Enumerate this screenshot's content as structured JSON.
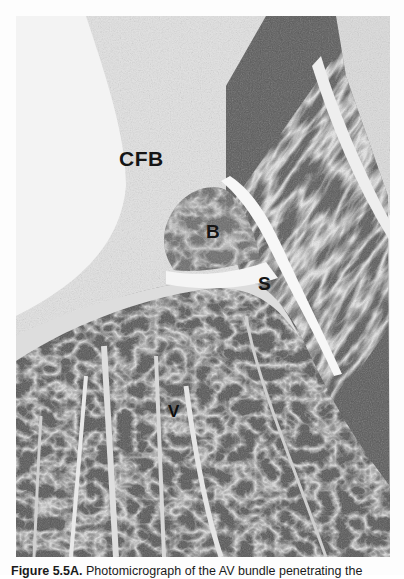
{
  "figure": {
    "type": "photomicrograph",
    "labels": {
      "cfb": "CFB",
      "b": "B",
      "s": "S",
      "v": "V"
    },
    "colors": {
      "connective_tissue": "#e6e6e6",
      "myocardium_dark": "#4a4a4a",
      "myocardium_mid": "#7a7a7a",
      "background": "#ffffff"
    }
  },
  "caption": {
    "figure_number": "Figure 5.5A.",
    "text": " Photomicrograph of the AV bundle penetrating the"
  }
}
